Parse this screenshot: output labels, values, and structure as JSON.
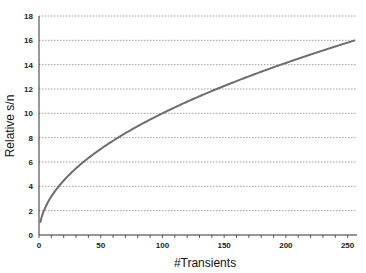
{
  "chart_data": {
    "type": "line",
    "title": "",
    "xlabel": "#Transients",
    "ylabel": "Relative s/n",
    "xlim": [
      0,
      256
    ],
    "ylim": [
      0,
      18
    ],
    "xticks": [
      0,
      50,
      100,
      150,
      200,
      250
    ],
    "yticks": [
      0,
      2,
      4,
      6,
      8,
      10,
      12,
      14,
      16,
      18
    ],
    "grid": {
      "horizontal": true,
      "vertical": false,
      "style": "dotted"
    },
    "legend": null,
    "series": [
      {
        "name": "Relative s/n",
        "color": "#6e6e6e",
        "function": "sqrt(x)",
        "x": [
          1,
          4,
          9,
          16,
          25,
          36,
          49,
          64,
          81,
          100,
          121,
          144,
          169,
          196,
          225,
          256
        ],
        "y": [
          1,
          2,
          3,
          4,
          5,
          6,
          7,
          8,
          9,
          10,
          11,
          12,
          13,
          14,
          15,
          16
        ]
      }
    ]
  },
  "labels": {
    "xlabel": "#Transients",
    "ylabel": "Relative s/n"
  }
}
